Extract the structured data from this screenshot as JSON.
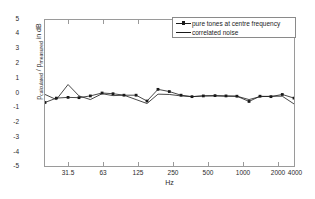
{
  "chart": {
    "xlabel": "Hz",
    "ylabel_main": "p",
    "ylabel_sub1": "calculated",
    "ylabel_mid": " / p",
    "ylabel_sub2": "measured",
    "ylabel_tail": "   in dB",
    "yticks": [
      "5",
      "4",
      "3",
      "2",
      "1",
      "0",
      "-1",
      "-2",
      "-3",
      "-4",
      "-5"
    ],
    "xticks": [
      "31.5",
      "63",
      "125",
      "250",
      "500",
      "1000",
      "2000",
      "4000"
    ],
    "legend": {
      "item1": "pure tones at centre frequency",
      "item2": "correlated noise"
    },
    "colors": {
      "line": "#1a1a1a",
      "axis": "#9a9a9a",
      "background": "#ffffff"
    }
  },
  "chart_data": {
    "type": "line",
    "title": "",
    "xlabel": "Hz",
    "ylabel": "p_calculated / p_measured   in dB",
    "xscale": "log",
    "xlim": [
      25,
      4000
    ],
    "ylim": [
      -5,
      5
    ],
    "grid": false,
    "legend_position": "top-right",
    "xticks": [
      31.5,
      63,
      125,
      250,
      500,
      1000,
      2000,
      4000
    ],
    "yticks": [
      -5,
      -4,
      -3,
      -2,
      -1,
      0,
      1,
      2,
      3,
      4,
      5
    ],
    "x": [
      25,
      31.5,
      40,
      50,
      63,
      80,
      100,
      125,
      160,
      200,
      250,
      315,
      400,
      500,
      630,
      800,
      1000,
      1250,
      1600,
      2000,
      2500,
      3150,
      4000
    ],
    "series": [
      {
        "name": "pure tones at centre frequency",
        "marker": "square",
        "values": [
          -0.65,
          -0.35,
          -0.3,
          -0.32,
          -0.2,
          0.0,
          -0.05,
          -0.15,
          -0.15,
          -0.55,
          0.25,
          0.1,
          -0.15,
          -0.25,
          -0.2,
          -0.18,
          -0.2,
          -0.22,
          -0.58,
          -0.22,
          -0.25,
          -0.1,
          -0.35
        ]
      },
      {
        "name": "correlated noise",
        "marker": "none",
        "values": [
          -0.1,
          -0.45,
          0.58,
          -0.2,
          -0.45,
          -0.05,
          -0.18,
          -0.15,
          -0.45,
          -0.72,
          -0.08,
          -0.1,
          -0.2,
          -0.25,
          -0.2,
          -0.2,
          -0.22,
          -0.22,
          -0.45,
          -0.25,
          -0.22,
          -0.22,
          -0.75
        ]
      }
    ]
  }
}
